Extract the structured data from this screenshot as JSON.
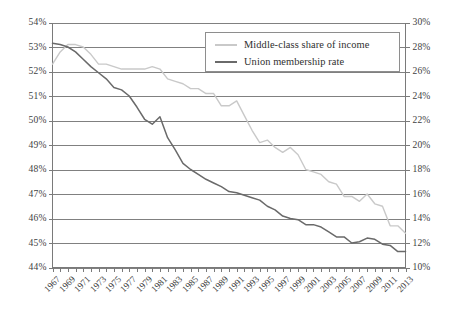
{
  "chart_data": {
    "type": "line",
    "title": "",
    "xlabel": "",
    "ylabel": "",
    "grid": true,
    "legend_position": "top-center",
    "x": [
      1967,
      1968,
      1969,
      1970,
      1971,
      1972,
      1973,
      1974,
      1975,
      1976,
      1977,
      1978,
      1979,
      1980,
      1981,
      1982,
      1983,
      1984,
      1985,
      1986,
      1987,
      1988,
      1989,
      1990,
      1991,
      1992,
      1993,
      1994,
      1995,
      1996,
      1997,
      1998,
      1999,
      2000,
      2001,
      2002,
      2003,
      2004,
      2005,
      2006,
      2007,
      2008,
      2009,
      2010,
      2011,
      2012,
      2013
    ],
    "x_tick_labels": [
      "1967",
      "1969",
      "1971",
      "1973",
      "1975",
      "1977",
      "1979",
      "1981",
      "1983",
      "1985",
      "1987",
      "1989",
      "1991",
      "1993",
      "1995",
      "1997",
      "1999",
      "2001",
      "2003",
      "2005",
      "2007",
      "2009",
      "2011",
      "2013"
    ],
    "axes": {
      "left": {
        "label": "",
        "ylim": [
          44,
          54
        ],
        "ticks": [
          44,
          45,
          46,
          47,
          48,
          49,
          50,
          51,
          52,
          53,
          54
        ],
        "tick_labels": [
          "44%",
          "45%",
          "46%",
          "47%",
          "48%",
          "49%",
          "50%",
          "51%",
          "52%",
          "53%",
          "54%"
        ],
        "unit": "%"
      },
      "right": {
        "label": "",
        "ylim": [
          10,
          30
        ],
        "ticks": [
          10,
          12,
          14,
          16,
          18,
          20,
          22,
          24,
          26,
          28,
          30
        ],
        "tick_labels": [
          "10%",
          "12%",
          "14%",
          "16%",
          "18%",
          "20%",
          "22%",
          "24%",
          "26%",
          "28%",
          "30%"
        ],
        "unit": "%"
      }
    },
    "series": [
      {
        "name": "Middle-class share of income",
        "axis": "left",
        "color": "#c9c9c9",
        "values": [
          52.3,
          52.8,
          53.1,
          53.1,
          53.0,
          52.7,
          52.3,
          52.3,
          52.2,
          52.1,
          52.1,
          52.1,
          52.1,
          52.2,
          52.1,
          51.7,
          51.6,
          51.5,
          51.3,
          51.3,
          51.1,
          51.1,
          50.6,
          50.6,
          50.8,
          50.2,
          49.6,
          49.1,
          49.2,
          48.9,
          48.7,
          48.9,
          48.6,
          48.0,
          47.9,
          47.8,
          47.5,
          47.4,
          46.9,
          46.9,
          46.7,
          47.0,
          46.6,
          46.5,
          45.7,
          45.7,
          45.4
        ]
      },
      {
        "name": "Union membership rate",
        "axis": "right",
        "color": "#6a6a6a",
        "values": [
          28.3,
          28.2,
          28.0,
          27.6,
          27.0,
          26.4,
          25.9,
          25.4,
          24.7,
          24.5,
          24.0,
          23.1,
          22.1,
          21.7,
          22.3,
          20.6,
          19.6,
          18.5,
          18.0,
          17.6,
          17.2,
          16.9,
          16.6,
          16.2,
          16.1,
          15.9,
          15.7,
          15.5,
          15.0,
          14.7,
          14.2,
          14.0,
          13.9,
          13.5,
          13.5,
          13.3,
          12.9,
          12.5,
          12.5,
          12.0,
          12.1,
          12.4,
          12.3,
          11.9,
          11.8,
          11.3,
          11.3
        ]
      }
    ]
  },
  "legend": {
    "items": [
      {
        "label": "Middle-class share of income",
        "color": "#c9c9c9"
      },
      {
        "label": "Union membership rate",
        "color": "#6a6a6a"
      }
    ]
  }
}
